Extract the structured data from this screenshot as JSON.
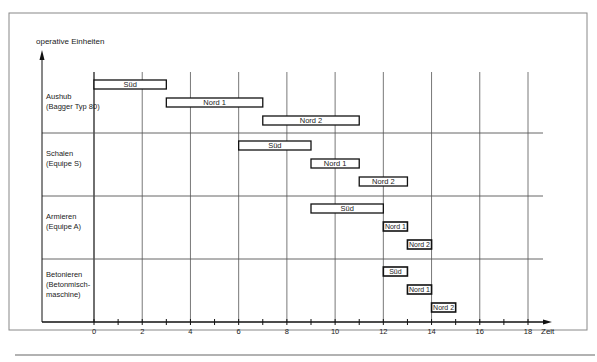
{
  "chart_data": {
    "type": "gantt",
    "title": "",
    "ylabel": "operative Einheiten",
    "xlabel": "Zeit",
    "xlim": [
      0,
      18
    ],
    "x_ticks": [
      0,
      2,
      4,
      6,
      8,
      10,
      12,
      14,
      16,
      18
    ],
    "x_minor_ticks": [
      1,
      3,
      5,
      7,
      9,
      11,
      13,
      15,
      17
    ],
    "grid": true,
    "groups": [
      {
        "label_lines": [
          "Aushub",
          "(Bagger Typ 80)"
        ],
        "tasks": [
          {
            "label": "Süd",
            "start": 0,
            "end": 3
          },
          {
            "label": "Nord 1",
            "start": 3,
            "end": 7
          },
          {
            "label": "Nord 2",
            "start": 7,
            "end": 11
          }
        ]
      },
      {
        "label_lines": [
          "Schalen",
          "(Equipe S)"
        ],
        "tasks": [
          {
            "label": "Süd",
            "start": 6,
            "end": 9
          },
          {
            "label": "Nord 1",
            "start": 9,
            "end": 11
          },
          {
            "label": "Nord 2",
            "start": 11,
            "end": 13
          }
        ]
      },
      {
        "label_lines": [
          "Armieren",
          "(Equipe A)"
        ],
        "tasks": [
          {
            "label": "Süd",
            "start": 9,
            "end": 12
          },
          {
            "label": "Nord 1",
            "start": 12,
            "end": 13
          },
          {
            "label": "Nord 2",
            "start": 13,
            "end": 14
          }
        ]
      },
      {
        "label_lines": [
          "Betonieren",
          "(Betonmisch-",
          "maschine)"
        ],
        "tasks": [
          {
            "label": "Süd",
            "start": 12,
            "end": 13
          },
          {
            "label": "Nord 1",
            "start": 13,
            "end": 14
          },
          {
            "label": "Nord 2",
            "start": 14,
            "end": 15
          }
        ]
      }
    ]
  }
}
